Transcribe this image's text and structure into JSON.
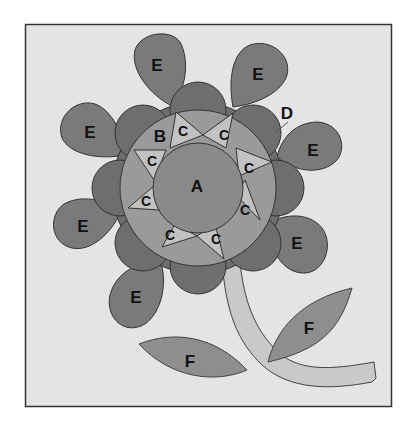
{
  "diagram": {
    "colors": {
      "background": "#ffffff",
      "frame_fill": "#e4e4e4",
      "frame_stroke": "#333333",
      "center_A": "#8a8a8a",
      "ring_B": "#9a9a9a",
      "points_C": "#c2c2c2",
      "scallop_D": "#6e6e6e",
      "petals_E": "#7a7a7a",
      "leaves_F": "#8e8e8e",
      "stem": "#c9c9c9",
      "outline": "#333333"
    },
    "labels": {
      "A": "A",
      "B": "B",
      "C": "C",
      "D": "D",
      "E": "E",
      "F": "F"
    },
    "parts": [
      {
        "label": "A",
        "description": "center circle"
      },
      {
        "label": "B",
        "description": "ring background segments"
      },
      {
        "label": "C",
        "description": "star point triangles",
        "count": 8
      },
      {
        "label": "D",
        "description": "scalloped outer ring"
      },
      {
        "label": "E",
        "description": "petals",
        "count": 8
      },
      {
        "label": "F",
        "description": "leaves",
        "count": 2
      }
    ]
  }
}
